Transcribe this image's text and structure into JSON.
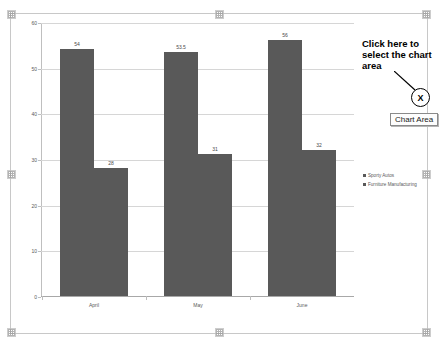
{
  "chart_data": {
    "type": "bar",
    "title": "",
    "xlabel": "",
    "ylabel": "",
    "categories": [
      "April",
      "May",
      "June"
    ],
    "series": [
      {
        "name": "Sporty Autos",
        "values": [
          54,
          53.5,
          56
        ],
        "color": "#595959"
      },
      {
        "name": "Furniture Manufacturing",
        "values": [
          28,
          31,
          32
        ],
        "color": "#595959"
      }
    ],
    "value_labels": [
      [
        "54",
        "53.5",
        "56"
      ],
      [
        "28",
        "31",
        "32"
      ]
    ],
    "ylim": [
      0,
      60
    ],
    "yticks": [
      "60",
      "50",
      "40",
      "30",
      "20",
      "10",
      "0"
    ],
    "ytick_values": [
      60,
      50,
      40,
      30,
      20,
      10,
      0
    ],
    "grid": true,
    "legend_position": "right"
  },
  "annotation": {
    "callout_text": "Click here to select the chart area",
    "marker_glyph": "X",
    "tooltip_label": "Chart Area"
  }
}
